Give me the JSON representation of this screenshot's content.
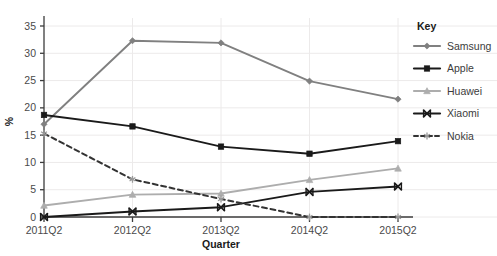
{
  "chart_data": {
    "type": "line",
    "title": "",
    "xlabel": "Quarter",
    "ylabel": "%",
    "categories": [
      "2011Q2",
      "2012Q2",
      "2013Q2",
      "2014Q2",
      "2015Q2"
    ],
    "ylim": [
      0,
      35
    ],
    "yticks": [
      0,
      5,
      10,
      15,
      20,
      25,
      30,
      35
    ],
    "grid": true,
    "legend_position": "right",
    "legend_title": "Key",
    "series": [
      {
        "name": "Samsung",
        "values": [
          17.0,
          32.3,
          31.9,
          24.9,
          21.6
        ],
        "color": "#808080",
        "marker": "diamond",
        "dash": false
      },
      {
        "name": "Apple",
        "values": [
          18.7,
          16.6,
          12.9,
          11.6,
          13.9
        ],
        "color": "#1a1a1a",
        "marker": "square",
        "dash": false
      },
      {
        "name": "Huawei",
        "values": [
          2.1,
          4.1,
          4.3,
          6.8,
          8.9
        ],
        "color": "#adadad",
        "marker": "triangle",
        "dash": false
      },
      {
        "name": "Xiaomi",
        "values": [
          0.0,
          1.0,
          1.8,
          4.6,
          5.6
        ],
        "color": "#1a1a1a",
        "marker": "cross",
        "dash": false
      },
      {
        "name": "Nokia",
        "values": [
          15.3,
          6.9,
          3.3,
          0.0,
          0.0
        ],
        "color": "#333333",
        "marker": "asterisk",
        "dash": true
      }
    ]
  },
  "axes": {
    "y_tick_labels": [
      "0",
      "5",
      "10",
      "15",
      "20",
      "25",
      "30",
      "35"
    ],
    "x_tick_labels": [
      "2011Q2",
      "2012Q2",
      "2013Q2",
      "2014Q2",
      "2015Q2"
    ],
    "y_axis_title": "%",
    "x_axis_title": "Quarter"
  },
  "legend": {
    "title": "Key",
    "items": [
      {
        "label": "Samsung"
      },
      {
        "label": "Apple"
      },
      {
        "label": "Huawei"
      },
      {
        "label": "Xiaomi"
      },
      {
        "label": "Nokia"
      }
    ]
  },
  "colors": {
    "grid": "#eceaea",
    "axis": "#3c3c3c",
    "background": "#ffffff"
  }
}
